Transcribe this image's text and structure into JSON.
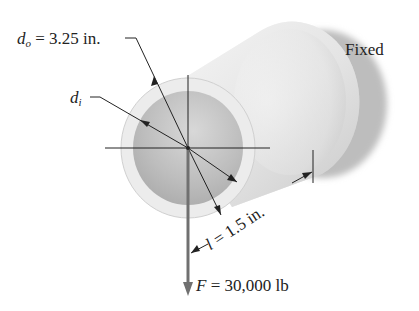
{
  "diagram": {
    "type": "engineering-free-body",
    "labels": {
      "outer_diameter": {
        "symbol": "d",
        "subscript": "o",
        "value": "= 3.25 in."
      },
      "inner_diameter": {
        "symbol": "d",
        "subscript": "i"
      },
      "length": {
        "symbol": "l",
        "value": "= 1.5 in."
      },
      "force": {
        "symbol": "F",
        "value": "= 30,000 lb"
      },
      "support": "Fixed"
    },
    "colors": {
      "outline": "#222222",
      "force_arrow": "#707070",
      "tube_face": "#e9e9e9",
      "bore": "#bdbdbd"
    }
  }
}
